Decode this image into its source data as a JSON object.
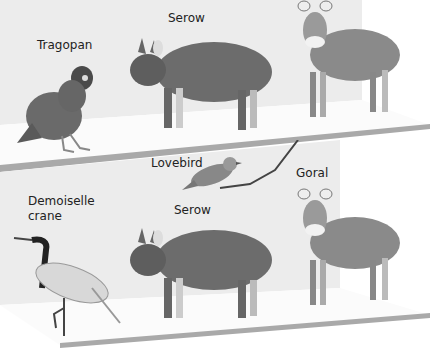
{
  "labels": {
    "tragopan": "Tragopan",
    "serow_top": "Serow",
    "lovebird": "Lovebird",
    "goral": "Goral",
    "demoiselle_line1": "Demoiselle",
    "demoiselle_line2": "crane",
    "serow_bottom": "Serow"
  },
  "colors": {
    "wall": "#ececec",
    "floor": "#fbfbfb",
    "shelf_edge": "#a9a9a9",
    "fur_dark": "#555555",
    "fur_mid": "#7a7a7a",
    "text": "#222222"
  }
}
